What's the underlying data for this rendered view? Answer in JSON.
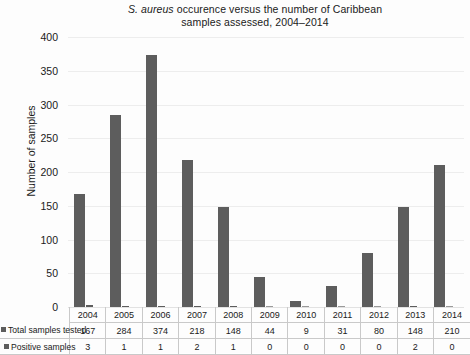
{
  "chart_data": {
    "type": "bar",
    "title": "S. aureus occurence versus the number of Caribbean samples assessed, 2004–2014",
    "title_line1_italic": "S. aureus",
    "title_line1_rest": " occurence versus the number of Caribbean",
    "title_line2": "samples assessed, 2004–2014",
    "xlabel": "",
    "ylabel": "Number of samples",
    "ylim": [
      0,
      400
    ],
    "ytick_values": [
      400,
      350,
      300,
      250,
      200,
      150,
      100,
      50,
      0
    ],
    "ytick_labels": [
      "400",
      "350",
      "300",
      "250",
      "200",
      "150",
      "100",
      "50",
      "0"
    ],
    "grid": true,
    "legend_position": "table-row-labels",
    "categories": [
      "2004",
      "2005",
      "2006",
      "2007",
      "2008",
      "2009",
      "2010",
      "2011",
      "2012",
      "2013",
      "2014"
    ],
    "series": [
      {
        "name": "Total samples tested",
        "color": "#5d5d5d",
        "values": [
          167,
          284,
          374,
          218,
          148,
          44,
          9,
          31,
          80,
          148,
          210
        ]
      },
      {
        "name": "Positive samples",
        "color": "#5d5d5d",
        "values": [
          3,
          1,
          1,
          2,
          1,
          0,
          0,
          0,
          0,
          2,
          0
        ]
      }
    ]
  },
  "table": {
    "year_row_label": "",
    "rows": [
      {
        "label": "Total samples tested",
        "values": [
          "167",
          "284",
          "374",
          "218",
          "148",
          "44",
          "9",
          "31",
          "80",
          "148",
          "210"
        ]
      },
      {
        "label": "Positive samples",
        "values": [
          "3",
          "1",
          "1",
          "2",
          "1",
          "0",
          "0",
          "0",
          "0",
          "2",
          "0"
        ]
      }
    ]
  },
  "colors": {
    "bar": "#5d5d5d",
    "grid": "#ededed",
    "background": "#fdfdfd",
    "text": "#1a1a1a",
    "table_border": "#c9c9c9"
  }
}
